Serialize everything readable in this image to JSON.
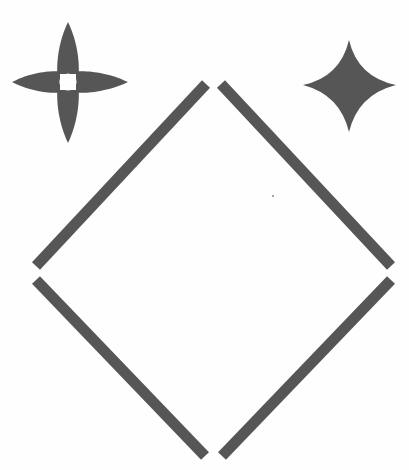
{
  "canvas": {
    "width": 409,
    "height": 470,
    "background_color": "#fefefe",
    "description": "Abstract black-and-white line figure: an open diamond outline built from four detached diagonal strokes, with a four-petal flower star at upper left and a concave four-pointed sparkle star at upper right."
  },
  "palette": {
    "shape_fill": "#565656",
    "shape_fill_alt": "#585858",
    "page_background": "#fefefe"
  },
  "shapes": [
    {
      "id": "flower-star",
      "name": "four-petal-flower-star",
      "kind": "petal-rosette",
      "petal_count": 4,
      "fill": "#565656",
      "center": {
        "x": 68,
        "y": 82
      },
      "bounds": {
        "x": 12,
        "y": 22,
        "width": 116,
        "height": 121
      },
      "center_gap_radius": 9,
      "petal_length_up": 60,
      "petal_length_down": 61,
      "petal_length_left": 56,
      "petal_length_right": 60,
      "petal_half_width": 13
    },
    {
      "id": "sparkle-star",
      "name": "concave-four-pointed-star",
      "kind": "astroid-sparkle",
      "point_count": 4,
      "fill": "#565656",
      "center": {
        "x": 349,
        "y": 86
      },
      "bounds": {
        "x": 303,
        "y": 40,
        "width": 93,
        "height": 92
      },
      "tip_up": {
        "x": 349,
        "y": 40
      },
      "tip_down": {
        "x": 349,
        "y": 132
      },
      "tip_left": {
        "x": 303,
        "y": 85
      },
      "tip_right": {
        "x": 396,
        "y": 85
      },
      "waist_radius": 24
    },
    {
      "id": "diamond-outline",
      "name": "open-diamond-outline",
      "kind": "four-detached-strokes",
      "fill": "#565656",
      "stroke_width": 11,
      "bounds": {
        "x": 32,
        "y": 80,
        "width": 365,
        "height": 378
      },
      "apex_top": {
        "x": 213,
        "y": 80
      },
      "apex_bottom": {
        "x": 213,
        "y": 458
      },
      "apex_left": {
        "x": 33,
        "y": 272
      },
      "apex_right": {
        "x": 394,
        "y": 272
      },
      "strokes": [
        {
          "id": "stroke-top-left",
          "name": "upper-left-edge",
          "x1": 206,
          "y1": 84,
          "x2": 36,
          "y2": 266
        },
        {
          "id": "stroke-top-right",
          "name": "upper-right-edge",
          "x1": 221,
          "y1": 84,
          "x2": 391,
          "y2": 266
        },
        {
          "id": "stroke-bottom-left",
          "name": "lower-left-edge",
          "x1": 36,
          "y1": 280,
          "x2": 205,
          "y2": 456
        },
        {
          "id": "stroke-bottom-right",
          "name": "lower-right-edge",
          "x1": 391,
          "y1": 280,
          "x2": 222,
          "y2": 456
        }
      ],
      "gaps": {
        "top_apex_px": 15,
        "left_apex_px": 14,
        "right_apex_px": 14,
        "bottom_apex_px": 17
      }
    }
  ],
  "speck": {
    "name": "stray-ink-speck",
    "x": 273,
    "y": 196,
    "radius": 1,
    "fill": "#8a8a8a"
  }
}
